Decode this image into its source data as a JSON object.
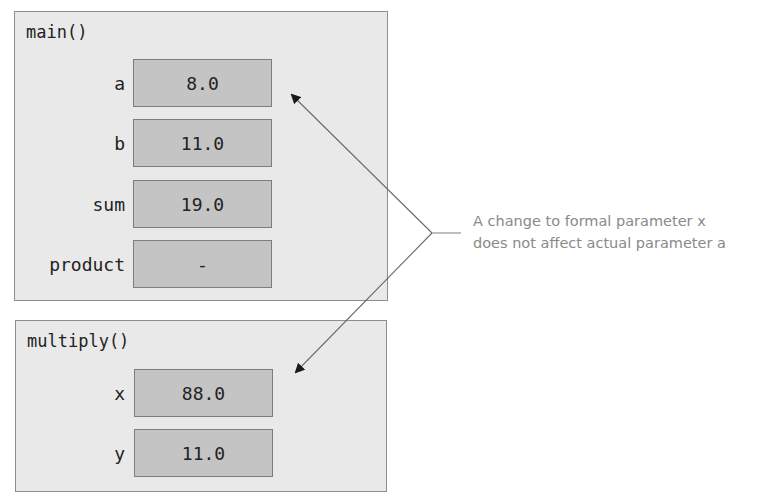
{
  "frames": {
    "main": {
      "title": "main()",
      "variables": [
        {
          "name": "a",
          "value": "8.0"
        },
        {
          "name": "b",
          "value": "11.0"
        },
        {
          "name": "sum",
          "value": "19.0"
        },
        {
          "name": "product",
          "value": "-"
        }
      ]
    },
    "multiply": {
      "title": "multiply()",
      "variables": [
        {
          "name": "x",
          "value": "88.0"
        },
        {
          "name": "y",
          "value": "11.0"
        }
      ]
    }
  },
  "annotation": {
    "line1": "A change to formal parameter x",
    "line2": "does not affect actual parameter a"
  },
  "colors": {
    "frame_bg": "#e9e9e9",
    "box_bg": "#c4c4c4",
    "annotation_text": "#8a8a8a",
    "arrow": "#6a6a6a"
  }
}
